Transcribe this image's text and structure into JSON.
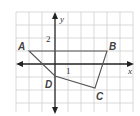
{
  "diagram": {
    "type": "coordinate-plane-polygon",
    "axes": {
      "x_label": "x",
      "y_label": "y"
    },
    "tick_labels": {
      "y_tick": "2",
      "x_tick": "1"
    },
    "grid": {
      "x_min": -3,
      "x_max": 6,
      "y_min": -4,
      "y_max": 4,
      "unit_px": 13
    },
    "polygon": {
      "name": "ABCD",
      "vertices": [
        {
          "label": "A",
          "x": -2,
          "y": 1
        },
        {
          "label": "B",
          "x": 4,
          "y": 1
        },
        {
          "label": "C",
          "x": 3,
          "y": -2
        },
        {
          "label": "D",
          "x": 0,
          "y": -1
        }
      ]
    },
    "colors": {
      "grid": "#cccccc",
      "axis": "#222222",
      "polygon": "#555555",
      "label": "#444444"
    }
  }
}
